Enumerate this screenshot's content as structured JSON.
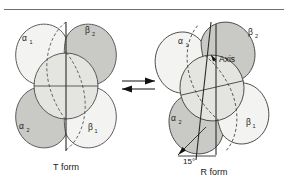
{
  "figure": {
    "top_rule": true,
    "background_color": "#ffffff",
    "outline_color": "#4a4a4a",
    "shade_dark": "#c9c9c6",
    "shade_light": "#f3f3f1"
  },
  "left_panel": {
    "caption": "T form",
    "subunits": [
      {
        "id": "alpha1",
        "greek": "α",
        "sub": "1",
        "shade": "light",
        "position": "upper-left"
      },
      {
        "id": "beta2",
        "greek": "β",
        "sub": "2",
        "shade": "dark",
        "position": "upper-right"
      },
      {
        "id": "alpha2",
        "greek": "α",
        "sub": "2",
        "shade": "dark",
        "position": "lower-left"
      },
      {
        "id": "beta1",
        "greek": "β",
        "sub": "1",
        "shade": "light",
        "position": "lower-right"
      }
    ],
    "axis_tilt_degrees": 0
  },
  "right_panel": {
    "caption": "R form",
    "axis_label": "Axis",
    "angle_label": "15°",
    "subunits": [
      {
        "id": "alpha1",
        "greek": "α",
        "sub": "1",
        "shade": "light",
        "position": "upper-left"
      },
      {
        "id": "beta2",
        "greek": "β",
        "sub": "2",
        "shade": "dark",
        "position": "upper-right"
      },
      {
        "id": "alpha2",
        "greek": "α",
        "sub": "2",
        "shade": "dark",
        "position": "lower-left"
      },
      {
        "id": "beta1",
        "greek": "β",
        "sub": "1",
        "shade": "light",
        "position": "lower-right"
      }
    ],
    "axis_tilt_degrees": 15
  },
  "equilibrium": {
    "symbol": "⇌",
    "top_arrow_direction": "right",
    "bottom_arrow_direction": "left"
  }
}
